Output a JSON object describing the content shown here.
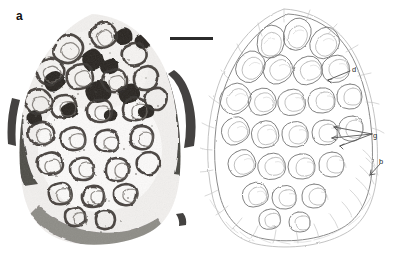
{
  "figure": {
    "type": "two-panel-comparative-micrograph",
    "background_color": "#ffffff",
    "width": 399,
    "height": 255
  },
  "panels": [
    {
      "letter": "a",
      "name": "panel-a",
      "kind": "photomicrograph",
      "description": "High-contrast black-and-white histological section through a brain-like organ showing densely convoluted folded laminae, with dark staining at the periphery and lighter interior.",
      "tone": {
        "ink": "#1b1b1b",
        "midtone": "#6f6f6f",
        "light": "#d8d8d8",
        "paper": "#ffffff"
      }
    },
    {
      "letter": "b",
      "name": "panel-b",
      "kind": "line-drawing",
      "description": "Interpretive line drawing of the same section, drawn in fine grey pen, showing the same convoluted laminae with annotation leader lines.",
      "tone": {
        "ink": "#707070",
        "midtone": "#9a9a9a",
        "light": "#c4c4c4",
        "paper": "#ffffff"
      }
    }
  ],
  "annotations": [
    {
      "id": "d",
      "label": "d",
      "panel": "b",
      "x": 352,
      "y": 66,
      "leader_to_x": 332,
      "leader_to_y": 76
    },
    {
      "id": "g",
      "label": "g",
      "panel": "b",
      "x": 373,
      "y": 132,
      "leader_to_x": 334,
      "leader_to_y": 130
    },
    {
      "id": "b",
      "label": "b",
      "panel": "b",
      "x": 379,
      "y": 158,
      "leader_to_x": 369,
      "leader_to_y": 170
    }
  ],
  "scale_bar": {
    "name": "scale-bar",
    "x": 170,
    "y": 37,
    "length_px": 43,
    "thickness_px": 3,
    "color": "#2b2b2b",
    "caption": ""
  }
}
